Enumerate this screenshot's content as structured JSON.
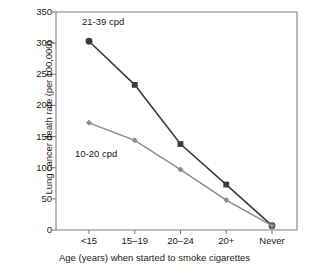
{
  "chart_data": {
    "type": "line",
    "title": "",
    "xlabel": "Age (years) when started to smoke cigarettes",
    "ylabel": "Lung cancer death rate (per 100,000)",
    "categories": [
      "<15",
      "15–19",
      "20–24",
      "20+",
      "Never"
    ],
    "series": [
      {
        "name": "21-39 cpd",
        "values": [
          303,
          233,
          138,
          73,
          7
        ],
        "color": "#3b3b3b",
        "marker": "circle-square"
      },
      {
        "name": "10-20 cpd",
        "values": [
          172,
          144,
          97,
          48,
          7
        ],
        "color": "#8c8c8c",
        "marker": "diamond"
      }
    ],
    "ylim": [
      0,
      350
    ],
    "yticks": [
      0,
      50,
      100,
      150,
      200,
      250,
      300,
      350
    ],
    "ytick_labels": [
      "0",
      "50",
      "100",
      "150",
      "200",
      "250",
      "300",
      "350"
    ],
    "grid": false,
    "legend": "inline-annotations",
    "annotations": [
      {
        "text": "21-39 cpd",
        "series": "21-39 cpd"
      },
      {
        "text": "10-20 cpd",
        "series": "10-20 cpd"
      }
    ]
  },
  "axes": {
    "y_title": "Lung cancer death rate (per 100,000)",
    "x_title": "Age (years) when started to smoke cigarettes"
  },
  "colors": {
    "series_high": "#3b3b3b",
    "series_low": "#8c8c8c",
    "axis": "#808080",
    "text": "#1a1a1a",
    "background": "#ffffff"
  }
}
